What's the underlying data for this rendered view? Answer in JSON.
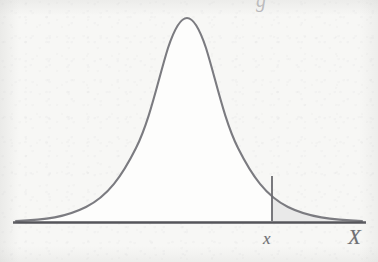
{
  "figure": {
    "kind": "normal-distribution-curve",
    "background_color": "#f7f7f5",
    "curve_color": "#7b7b80",
    "axis_color": "#55555a",
    "curve_fill_color": "#fdfdfd",
    "tail_shade_color": "#e9e9e9",
    "label_color": "#6f6f73"
  },
  "axis": {
    "name": "horizontal-axis",
    "start_x": 13,
    "end_x": 366,
    "y": 222,
    "thickness": 3
  },
  "curve": {
    "peak_x": 187,
    "peak_y": 18,
    "left_foot_x": 16,
    "right_foot_x": 362,
    "baseline_y": 221,
    "stroke_width": 2.1
  },
  "boundary": {
    "name": "x-boundary-line",
    "x": 272,
    "top_y": 176,
    "bottom_y": 221,
    "stroke_width": 1.8
  },
  "shaded_region": {
    "name": "right-tail-shaded-area",
    "from_x": 272,
    "to_x": 362,
    "fill": "#e9e9e9"
  },
  "labels": {
    "x_lower": "x",
    "x_upper": "X",
    "cropped_remnant": "g"
  }
}
